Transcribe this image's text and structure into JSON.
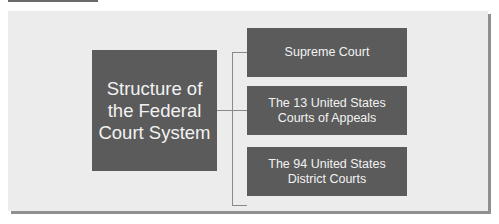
{
  "diagram": {
    "type": "hierarchy",
    "root": {
      "label_lines": [
        "Structure of",
        "the Federal",
        "Court System"
      ]
    },
    "children": [
      {
        "label_lines": [
          "Supreme Court"
        ]
      },
      {
        "label_lines": [
          "The 13 United States",
          "Courts of Appeals"
        ]
      },
      {
        "label_lines": [
          "The 94 United States",
          "District Courts"
        ]
      }
    ]
  },
  "colors": {
    "panel_background": "#ececec",
    "box_fill": "#5b5b5b",
    "box_text": "#f2f2f2",
    "connector": "#8a8a8a"
  }
}
